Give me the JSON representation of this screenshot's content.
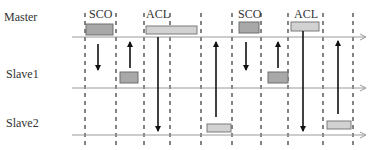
{
  "rows": [
    {
      "label": "Master",
      "y": 37,
      "label_x": 4,
      "label_y": 11
    },
    {
      "label": "Slave1",
      "y": 88,
      "label_x": 6,
      "label_y": 69
    },
    {
      "label": "Slave2",
      "y": 135,
      "label_x": 6,
      "label_y": 117
    }
  ],
  "timeline": {
    "x_start": 72,
    "x_end": 365,
    "color": "#9a9a9a"
  },
  "slot_boundaries": [
    85,
    116,
    144,
    170,
    201,
    232,
    261,
    288,
    323,
    353
  ],
  "packet_labels": [
    {
      "text": "SCO",
      "x": 89,
      "y": 10
    },
    {
      "text": "ACL",
      "x": 146,
      "y": 10
    },
    {
      "text": "SCO",
      "x": 238,
      "y": 10
    },
    {
      "text": "ACL",
      "x": 294,
      "y": 10
    }
  ],
  "packets": [
    {
      "type": "SCO",
      "row": "Master",
      "x": 86,
      "y": 24,
      "w": 27,
      "h": 11
    },
    {
      "type": "SCO",
      "row": "Slave1",
      "x": 120,
      "y": 72,
      "w": 18,
      "h": 11
    },
    {
      "type": "ACL",
      "row": "Master",
      "x": 146,
      "y": 26,
      "w": 51,
      "h": 8
    },
    {
      "type": "ACL",
      "row": "Slave2",
      "x": 207,
      "y": 124,
      "w": 24,
      "h": 8
    },
    {
      "type": "SCO",
      "row": "Master",
      "x": 239,
      "y": 22,
      "w": 20,
      "h": 11
    },
    {
      "type": "SCO",
      "row": "Slave1",
      "x": 268,
      "y": 72,
      "w": 20,
      "h": 11
    },
    {
      "type": "ACL",
      "row": "Master",
      "x": 291,
      "y": 22,
      "w": 28,
      "h": 9
    },
    {
      "type": "ACL",
      "row": "Slave2",
      "x": 327,
      "y": 121,
      "w": 24,
      "h": 8
    }
  ],
  "arrows": [
    {
      "dir": "down",
      "x": 98,
      "y1": 44,
      "y2": 70
    },
    {
      "dir": "up",
      "x": 130,
      "y1": 68,
      "y2": 42
    },
    {
      "dir": "down",
      "x": 158,
      "y1": 37,
      "y2": 131
    },
    {
      "dir": "up",
      "x": 216,
      "y1": 117,
      "y2": 42
    },
    {
      "dir": "down",
      "x": 246,
      "y1": 42,
      "y2": 70
    },
    {
      "dir": "up",
      "x": 278,
      "y1": 68,
      "y2": 42
    },
    {
      "dir": "down",
      "x": 303,
      "y1": 31,
      "y2": 131
    },
    {
      "dir": "up",
      "x": 338,
      "y1": 114,
      "y2": 41
    }
  ],
  "colors": {
    "sco_fill": "#a8a8a8",
    "sco_stroke": "#6e6e6e",
    "acl_fill": "#d2d2d2",
    "acl_stroke": "#7a7a7a",
    "dash": "#333333",
    "arrow": "#111111"
  }
}
